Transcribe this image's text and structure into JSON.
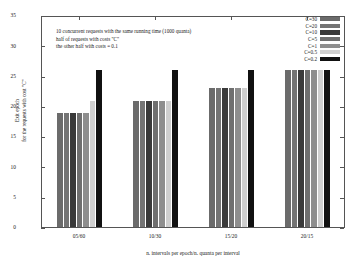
{
  "chart_data": {
    "type": "bar",
    "title": "",
    "xlabel": "n. intervals per epoch/n. quanta per interval",
    "ylabel_line1": "Exit epoch",
    "ylabel_line2": "for the requests with cost \"C\"",
    "categories": [
      "05/60",
      "10/30",
      "15/20",
      "20/15"
    ],
    "ylim": [
      0,
      35
    ],
    "yticks": [
      "0",
      "5",
      "10",
      "15",
      "20",
      "25",
      "30",
      "35"
    ],
    "grid": false,
    "legend_position": "top-right",
    "series": [
      {
        "name": "C=30",
        "color": "#6b6b6b",
        "values": [
          19.0,
          21.0,
          23.1,
          26.2
        ]
      },
      {
        "name": "C=20",
        "color": "#747474",
        "values": [
          19.0,
          21.0,
          23.1,
          26.2
        ]
      },
      {
        "name": "C=10",
        "color": "#3a3a3a",
        "values": [
          19.0,
          21.0,
          23.1,
          26.2
        ]
      },
      {
        "name": "C=5",
        "color": "#6f6f6f",
        "values": [
          19.0,
          21.0,
          23.1,
          26.2
        ]
      },
      {
        "name": "C=1",
        "color": "#8e8e8e",
        "values": [
          19.0,
          21.0,
          23.1,
          26.2
        ]
      },
      {
        "name": "C=0.5",
        "color": "#cfcfcf",
        "values": [
          21.0,
          21.0,
          23.1,
          26.2
        ]
      },
      {
        "name": "C=0.2",
        "color": "#111111",
        "values": [
          26.1,
          26.1,
          26.2,
          26.2
        ]
      }
    ],
    "annotation": [
      "10 concurrent requests with the same running time (1000 quanta)",
      "half of requests with costs \"C\"",
      "the other half with costs = 0.1"
    ]
  }
}
